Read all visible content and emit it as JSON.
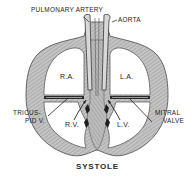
{
  "diagram": {
    "title": "SYSTOLE",
    "labels": {
      "pulmonary_artery": "PULMONARY ARTERY",
      "aorta": "AORTA",
      "right_atrium": "R.A.",
      "left_atrium": "L.A.",
      "right_ventricle": "R.V.",
      "left_ventricle": "L.V.",
      "tricuspid_line1": "TRICUS-",
      "tricuspid_line2": "PID V.",
      "mitral_line1": "MITRAL",
      "mitral_line2": "VALVE"
    },
    "colors": {
      "wall_fill": "#b8b8b8",
      "wall_stroke": "#4a4a4a",
      "chamber_fill": "#ffffff",
      "valve": "#2a2a2a",
      "text": "#222222"
    }
  }
}
